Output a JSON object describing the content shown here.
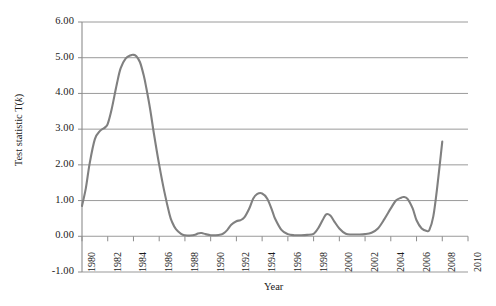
{
  "chart_data": {
    "type": "line",
    "title": "",
    "xlabel": "Year",
    "ylabel": "Test statistic T(k)",
    "ylabel_prefix": "Test statistic T(",
    "ylabel_italic": "k",
    "ylabel_suffix": ")",
    "xlim": [
      1980,
      2010
    ],
    "ylim": [
      -1.0,
      6.0
    ],
    "grid": true,
    "legend": "none",
    "line_color": "#808080",
    "grid_color": "#9a9a9a",
    "axis_color": "#8c8c8c",
    "background_color": "#ffffff",
    "text_color": "#1a1a1a",
    "x_ticks": [
      1980,
      1982,
      1984,
      1986,
      1988,
      1990,
      1992,
      1994,
      1996,
      1998,
      2000,
      2002,
      2004,
      2006,
      2008,
      2010
    ],
    "x_tick_labels": [
      "1980",
      "1982",
      "1984",
      "1986",
      "1988",
      "1990",
      "1992",
      "1994",
      "1996",
      "1998",
      "2000",
      "2002",
      "2004",
      "2006",
      "2008",
      "2010"
    ],
    "y_ticks": [
      -1.0,
      0.0,
      1.0,
      2.0,
      3.0,
      4.0,
      5.0,
      6.0
    ],
    "y_tick_labels": [
      "-1.00",
      "0.00",
      "1.00",
      "2.00",
      "3.00",
      "4.00",
      "5.00",
      "6.00"
    ],
    "series": [
      {
        "name": "T(k)",
        "x": [
          1980.0,
          1980.3,
          1980.6,
          1981.0,
          1981.4,
          1981.8,
          1982.0,
          1982.3,
          1982.7,
          1983.0,
          1983.4,
          1983.8,
          1984.0,
          1984.2,
          1984.5,
          1984.8,
          1985.0,
          1985.3,
          1985.6,
          1986.0,
          1986.4,
          1986.8,
          1987.0,
          1987.3,
          1987.7,
          1988.0,
          1988.4,
          1988.8,
          1989.0,
          1989.3,
          1989.6,
          1990.0,
          1990.4,
          1990.8,
          1991.0,
          1991.3,
          1991.6,
          1992.0,
          1992.3,
          1992.6,
          1993.0,
          1993.3,
          1993.6,
          1994.0,
          1994.4,
          1994.8,
          1995.0,
          1995.5,
          1996.0,
          1996.5,
          1997.0,
          1997.5,
          1998.0,
          1998.4,
          1998.8,
          1999.0,
          1999.3,
          1999.6,
          2000.0,
          2000.5,
          2001.0,
          2001.5,
          2002.0,
          2002.5,
          2003.0,
          2003.5,
          2004.0,
          2004.4,
          2004.8,
          2005.0,
          2005.3,
          2005.7,
          2006.0,
          2006.4,
          2006.8,
          2007.0,
          2007.3,
          2007.6,
          2008.0
        ],
        "y": [
          0.85,
          1.35,
          2.05,
          2.72,
          2.95,
          3.05,
          3.15,
          3.55,
          4.25,
          4.7,
          4.98,
          5.07,
          5.08,
          5.05,
          4.88,
          4.5,
          4.15,
          3.55,
          2.85,
          2.0,
          1.25,
          0.62,
          0.4,
          0.2,
          0.07,
          0.03,
          0.02,
          0.04,
          0.08,
          0.09,
          0.06,
          0.03,
          0.03,
          0.05,
          0.08,
          0.18,
          0.32,
          0.42,
          0.45,
          0.52,
          0.78,
          1.05,
          1.18,
          1.2,
          1.05,
          0.7,
          0.5,
          0.18,
          0.06,
          0.03,
          0.03,
          0.04,
          0.07,
          0.25,
          0.52,
          0.62,
          0.58,
          0.42,
          0.22,
          0.07,
          0.05,
          0.05,
          0.06,
          0.1,
          0.22,
          0.48,
          0.78,
          1.0,
          1.08,
          1.1,
          1.05,
          0.78,
          0.45,
          0.22,
          0.15,
          0.18,
          0.55,
          1.35,
          2.65
        ]
      }
    ]
  }
}
